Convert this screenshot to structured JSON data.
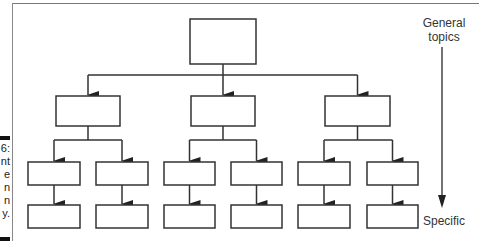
{
  "figure": {
    "caption_fragments": [
      "6:",
      "nt",
      "e",
      "n",
      "n",
      "y."
    ],
    "scale_labels": {
      "top": "General topics",
      "top_lines": [
        "General",
        "topics"
      ],
      "bottom": "Specific"
    },
    "colors": {
      "box_border": "#333333",
      "arrow": "#222222",
      "frame": "#888888",
      "text": "#333333"
    }
  },
  "hierarchy": {
    "levels": 4,
    "root": {
      "box": {
        "x": 190,
        "y": 19,
        "w": 66,
        "h": 45
      },
      "children": [
        {
          "box": {
            "x": 56,
            "y": 96,
            "w": 64,
            "h": 30
          },
          "children": [
            {
              "box": {
                "x": 28,
                "y": 162,
                "w": 52,
                "h": 23
              },
              "child": {
                "x": 28,
                "y": 205,
                "w": 52,
                "h": 23
              }
            },
            {
              "box": {
                "x": 96,
                "y": 162,
                "w": 52,
                "h": 23
              },
              "child": {
                "x": 96,
                "y": 205,
                "w": 52,
                "h": 23
              }
            }
          ]
        },
        {
          "box": {
            "x": 191,
            "y": 96,
            "w": 64,
            "h": 30
          },
          "children": [
            {
              "box": {
                "x": 164,
                "y": 162,
                "w": 51,
                "h": 23
              },
              "child": {
                "x": 164,
                "y": 205,
                "w": 51,
                "h": 23
              }
            },
            {
              "box": {
                "x": 231,
                "y": 162,
                "w": 51,
                "h": 23
              },
              "child": {
                "x": 231,
                "y": 205,
                "w": 51,
                "h": 23
              }
            }
          ]
        },
        {
          "box": {
            "x": 325,
            "y": 96,
            "w": 65,
            "h": 30
          },
          "children": [
            {
              "box": {
                "x": 298,
                "y": 162,
                "w": 52,
                "h": 23
              },
              "child": {
                "x": 298,
                "y": 205,
                "w": 52,
                "h": 23
              }
            },
            {
              "box": {
                "x": 367,
                "y": 162,
                "w": 51,
                "h": 23
              },
              "child": {
                "x": 367,
                "y": 205,
                "w": 51,
                "h": 23
              }
            }
          ]
        }
      ]
    }
  }
}
